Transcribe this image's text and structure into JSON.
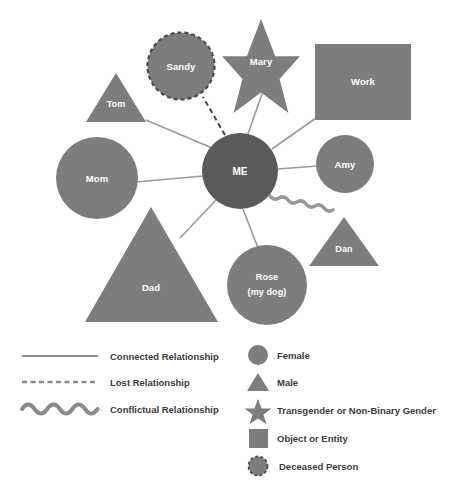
{
  "diagram": {
    "colors": {
      "node_fill": "#7d7d7d",
      "center_fill": "#5a5a5a",
      "line": "#9a9a9a",
      "label_text": "#ffffff",
      "legend_text": "#3b3b3b",
      "background": "#ffffff"
    },
    "nodes": [
      {
        "id": "me",
        "label": "ME",
        "shape": "circle",
        "role": "center"
      },
      {
        "id": "sandy",
        "label": "Sandy",
        "shape": "dashed-circle",
        "role": "deceased-person"
      },
      {
        "id": "mary",
        "label": "Mary",
        "shape": "star",
        "role": "transgender-or-non-binary"
      },
      {
        "id": "work",
        "label": "Work",
        "shape": "square",
        "role": "object-or-entity"
      },
      {
        "id": "tom",
        "label": "Tom",
        "shape": "triangle",
        "role": "male"
      },
      {
        "id": "mom",
        "label": "Mom",
        "shape": "circle",
        "role": "female"
      },
      {
        "id": "dad",
        "label": "Dad",
        "shape": "triangle",
        "role": "male"
      },
      {
        "id": "amy",
        "label": "Amy",
        "shape": "circle",
        "role": "female"
      },
      {
        "id": "dan",
        "label": "Dan",
        "shape": "triangle",
        "role": "male"
      },
      {
        "id": "rose",
        "label_line1": "Rose",
        "label_line2": "(my dog)",
        "shape": "circle",
        "role": "female"
      }
    ],
    "connections": [
      {
        "from": "me",
        "to": "sandy",
        "type": "lost"
      },
      {
        "from": "me",
        "to": "mary",
        "type": "connected"
      },
      {
        "from": "me",
        "to": "work",
        "type": "connected"
      },
      {
        "from": "me",
        "to": "tom",
        "type": "connected"
      },
      {
        "from": "me",
        "to": "mom",
        "type": "connected"
      },
      {
        "from": "me",
        "to": "dad",
        "type": "connected"
      },
      {
        "from": "me",
        "to": "amy",
        "type": "connected"
      },
      {
        "from": "me",
        "to": "rose",
        "type": "connected"
      },
      {
        "from": "me",
        "to": "dan",
        "type": "conflictual"
      }
    ]
  },
  "legend": {
    "relationships": [
      {
        "key": "connected",
        "label": "Connected Relationship",
        "symbol": "solid-line"
      },
      {
        "key": "lost",
        "label": "Lost Relationship",
        "symbol": "dashed-line"
      },
      {
        "key": "conflictual",
        "label": "Conflictual Relationship",
        "symbol": "wavy-line"
      }
    ],
    "symbols": [
      {
        "key": "female",
        "label": "Female",
        "symbol": "circle"
      },
      {
        "key": "male",
        "label": "Male",
        "symbol": "triangle"
      },
      {
        "key": "transgender",
        "label": "Transgender or Non-Binary Gender",
        "symbol": "star"
      },
      {
        "key": "object",
        "label": "Object or Entity",
        "symbol": "square"
      },
      {
        "key": "deceased",
        "label": "Deceased Person",
        "symbol": "dashed-circle"
      }
    ]
  }
}
